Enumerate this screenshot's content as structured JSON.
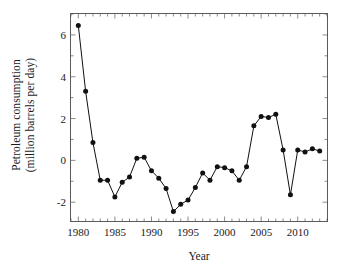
{
  "chart_data": {
    "type": "line",
    "title": "",
    "xlabel": "Year",
    "ylabel": "Petroleum consumption (million barrels per day)",
    "ylabel_line1": "Petroleum consumption",
    "ylabel_line2": "(million barrels per day)",
    "xlim": [
      1979,
      2014
    ],
    "ylim": [
      -2.9,
      7.0
    ],
    "grid": false,
    "legend": null,
    "xticks": [
      1980,
      1985,
      1990,
      1995,
      2000,
      2005,
      2010
    ],
    "xtick_labels": [
      "1980",
      "1985",
      "1990",
      "1995",
      "2000",
      "2005",
      "2010"
    ],
    "xminor_step": 1,
    "yticks": [
      -2,
      0,
      2,
      4,
      6
    ],
    "ytick_labels": [
      "-2",
      "0",
      "2",
      "4",
      "6"
    ],
    "marker": "circle",
    "marker_color": "#111111",
    "line_color": "#111111",
    "x": [
      1980,
      1981,
      1982,
      1983,
      1984,
      1985,
      1986,
      1987,
      1988,
      1989,
      1990,
      1991,
      1992,
      1993,
      1994,
      1995,
      1996,
      1997,
      1998,
      1999,
      2000,
      2001,
      2002,
      2003,
      2004,
      2005,
      2006,
      2007,
      2008,
      2009,
      2010,
      2011,
      2012,
      2013
    ],
    "values": [
      6.45,
      3.3,
      0.85,
      -0.95,
      -0.95,
      -1.75,
      -1.05,
      -0.8,
      0.1,
      0.15,
      -0.5,
      -0.85,
      -1.35,
      -2.45,
      -2.1,
      -1.9,
      -1.3,
      -0.6,
      -0.95,
      -0.3,
      -0.35,
      -0.5,
      -0.95,
      -0.3,
      1.65,
      2.1,
      2.05,
      2.2,
      0.5,
      -1.65,
      0.5,
      0.4,
      0.55,
      0.45
    ],
    "series": [
      {
        "name": "Petroleum consumption",
        "values": [
          6.45,
          3.3,
          0.85,
          -0.95,
          -0.95,
          -1.75,
          -1.05,
          -0.8,
          0.1,
          0.15,
          -0.5,
          -0.85,
          -1.35,
          -2.45,
          -2.1,
          -1.9,
          -1.3,
          -0.6,
          -0.95,
          -0.3,
          -0.35,
          -0.5,
          -0.95,
          -0.3,
          1.65,
          2.1,
          2.05,
          2.2,
          0.5,
          -1.65,
          0.5,
          0.4,
          0.55,
          0.45
        ]
      }
    ]
  }
}
